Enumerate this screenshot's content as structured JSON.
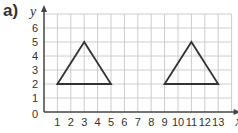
{
  "question_label": "a)",
  "chart_data": {
    "type": "line",
    "title": "",
    "xlabel": "x",
    "ylabel": "y",
    "xlim": [
      0,
      14
    ],
    "ylim": [
      0,
      7
    ],
    "grid": true,
    "x_ticks": [
      "1",
      "2",
      "3",
      "4",
      "5",
      "6",
      "7",
      "8",
      "9",
      "10",
      "11",
      "12",
      "13"
    ],
    "y_ticks": [
      "1",
      "2",
      "3",
      "4",
      "5",
      "6"
    ],
    "origin_label": "0",
    "series": [
      {
        "name": "triangle-left",
        "points": [
          [
            1,
            2
          ],
          [
            3,
            5
          ],
          [
            5,
            2
          ]
        ],
        "closed": true,
        "color": "#333333"
      },
      {
        "name": "triangle-right",
        "points": [
          [
            9,
            2
          ],
          [
            11,
            5
          ],
          [
            13,
            2
          ]
        ],
        "closed": true,
        "color": "#333333"
      }
    ]
  },
  "colors": {
    "grid": "#cccccc",
    "axis": "#444444",
    "shape": "#333333",
    "text": "#333333"
  }
}
